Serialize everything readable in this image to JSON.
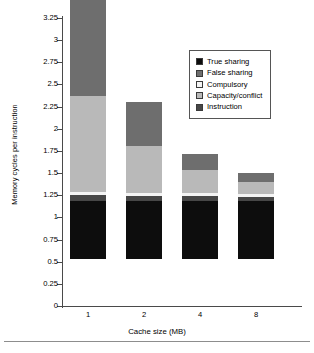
{
  "chart_data": {
    "type": "bar",
    "subtype": "stacked-bar",
    "title": "",
    "xlabel": "Cache size (MB)",
    "ylabel": "Memory cycles per instruction",
    "categories": [
      "1",
      "2",
      "4",
      "8"
    ],
    "ylim": [
      0,
      3.25
    ],
    "ytick_labels": [
      "3.25",
      "3",
      "2.75",
      "2.5",
      "2.25",
      "2",
      "1.75",
      "1.5",
      "1.25",
      "1",
      "0.75",
      "0.5",
      "0.25",
      "0"
    ],
    "ytick_values": [
      3.25,
      3,
      2.75,
      2.5,
      2.25,
      2,
      1.75,
      1.5,
      1.25,
      1,
      0.75,
      0.5,
      0.25,
      0
    ],
    "grid": false,
    "legend_position": "upper right",
    "stack_order_bottom_to_top": [
      "True sharing",
      "Instruction",
      "Compulsory",
      "Capacity/conflict",
      "False sharing"
    ],
    "series": [
      {
        "name": "True sharing",
        "color": "#0d0d0d",
        "values": [
          0.66,
          0.65,
          0.66,
          0.65
        ]
      },
      {
        "name": "Instruction",
        "color": "#474747",
        "values": [
          0.06,
          0.06,
          0.05,
          0.05
        ]
      },
      {
        "name": "Compulsory",
        "color": "#f4f4f4",
        "values": [
          0.04,
          0.04,
          0.03,
          0.03
        ]
      },
      {
        "name": "Capacity/conflict",
        "color": "#b9b9b9",
        "values": [
          1.08,
          0.53,
          0.26,
          0.14
        ]
      },
      {
        "name": "False sharing",
        "color": "#6e6e6e",
        "values": [
          1.41,
          0.49,
          0.19,
          0.1
        ]
      }
    ],
    "totals": [
      3.25,
      1.77,
      1.19,
      0.97
    ]
  },
  "legend": {
    "entries": [
      {
        "label": "True sharing",
        "color": "#0d0d0d"
      },
      {
        "label": "False sharing",
        "color": "#6e6e6e"
      },
      {
        "label": "Compulsory",
        "color": "#f4f4f4"
      },
      {
        "label": "Capacity/conflict",
        "color": "#b9b9b9"
      },
      {
        "label": "Instruction",
        "color": "#474747"
      }
    ]
  }
}
